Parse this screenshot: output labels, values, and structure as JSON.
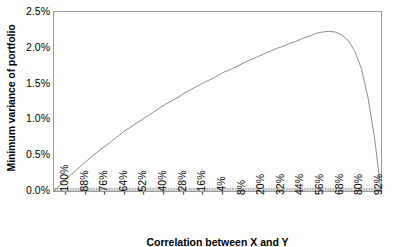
{
  "chart_data": {
    "type": "line",
    "title": "",
    "xlabel": "Correlation between X and Y",
    "ylabel": "Minimum variance of portfolio",
    "xlim": [
      -100,
      100
    ],
    "ylim": [
      0,
      2.5
    ],
    "grid": false,
    "legend": null,
    "x_tick_labels": [
      "-100%",
      "-88%",
      "-76%",
      "-64%",
      "-52%",
      "-40%",
      "-28%",
      "-16%",
      "-4%",
      "8%",
      "20%",
      "32%",
      "44%",
      "56%",
      "68%",
      "80%",
      "92%"
    ],
    "x_tick_values": [
      -100,
      -88,
      -76,
      -64,
      -52,
      -40,
      -28,
      -16,
      -4,
      8,
      20,
      32,
      44,
      56,
      68,
      80,
      92
    ],
    "y_tick_labels": [
      "0.0%",
      "0.5%",
      "1.0%",
      "1.5%",
      "2.0%",
      "2.5%"
    ],
    "y_tick_values": [
      0,
      0.5,
      1.0,
      1.5,
      2.0,
      2.5
    ],
    "series": [
      {
        "name": "Minimum variance of portfolio",
        "color": "#808080",
        "x": [
          -100,
          -96,
          -92,
          -88,
          -84,
          -80,
          -76,
          -72,
          -68,
          -64,
          -60,
          -56,
          -52,
          -48,
          -44,
          -40,
          -36,
          -32,
          -28,
          -24,
          -20,
          -16,
          -12,
          -8,
          -4,
          0,
          4,
          8,
          12,
          16,
          20,
          24,
          28,
          32,
          36,
          40,
          44,
          48,
          52,
          56,
          60,
          64,
          68,
          72,
          76,
          80,
          84,
          88,
          92,
          96,
          100
        ],
        "values": [
          0.0,
          0.09,
          0.18,
          0.26,
          0.34,
          0.42,
          0.5,
          0.57,
          0.64,
          0.71,
          0.78,
          0.85,
          0.91,
          0.97,
          1.03,
          1.09,
          1.15,
          1.21,
          1.26,
          1.31,
          1.37,
          1.42,
          1.47,
          1.52,
          1.56,
          1.61,
          1.66,
          1.7,
          1.74,
          1.79,
          1.83,
          1.87,
          1.91,
          1.95,
          1.99,
          2.02,
          2.06,
          2.09,
          2.13,
          2.16,
          2.2,
          2.22,
          2.23,
          2.22,
          2.18,
          2.1,
          1.95,
          1.71,
          1.31,
          0.75,
          0.0
        ]
      }
    ]
  }
}
